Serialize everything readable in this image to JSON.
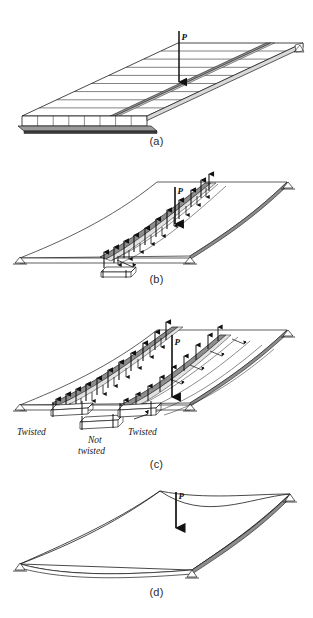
{
  "figure": {
    "background_color": "#ffffff",
    "line_color": "#1a1a1a",
    "beam_fill": "#8d8d8d",
    "beam_fill_light": "#b9b9b9",
    "width": 313,
    "height": 618
  },
  "panels": [
    {
      "id": "a",
      "caption": "(a)",
      "description": "Flat plate divided into parallel strips with concentrated load P applied at mid-strip",
      "load_label": "P"
    },
    {
      "id": "b",
      "caption": "(b)",
      "description": "Deflected plate with one strip isolated showing distributed interaction forces and load P",
      "load_label": "P"
    },
    {
      "id": "c",
      "caption": "(c)",
      "description": "Deflected plate with two crossing strips showing twisted and not twisted regions",
      "load_label": "P"
    },
    {
      "id": "d",
      "caption": "(d)",
      "description": "Deflected plate surface under concentrated load P",
      "load_label": "P"
    }
  ],
  "annotations": {
    "twisted_left": "Twisted",
    "not_twisted": "Not\ntwisted",
    "not_twisted_line1": "Not",
    "not_twisted_line2": "twisted",
    "twisted_right": "Twisted"
  },
  "captions": {
    "a": "(a)",
    "b": "(b)",
    "c": "(c)",
    "d": "(d)"
  },
  "load": {
    "symbol": "P"
  }
}
